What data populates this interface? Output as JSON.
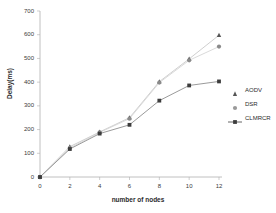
{
  "chart_data": {
    "type": "line",
    "title": "",
    "xlabel": "number of nodes",
    "ylabel": "Delay(ms)",
    "x": [
      0,
      2,
      4,
      6,
      8,
      10,
      12
    ],
    "xlim": [
      0,
      12
    ],
    "ylim": [
      0,
      700
    ],
    "xticks": [
      "0",
      "2",
      "4",
      "6",
      "8",
      "10",
      "12"
    ],
    "yticks": [
      "0",
      "100",
      "200",
      "300",
      "400",
      "500",
      "600",
      "700"
    ],
    "grid": false,
    "legend_position": "right",
    "series": [
      {
        "name": "AODV",
        "marker": "triangle",
        "color": "#555555",
        "line_color": "#c9c9c9",
        "values": [
          0,
          128,
          190,
          250,
          402,
          498,
          598
        ]
      },
      {
        "name": "DSR",
        "marker": "circle",
        "color": "#8a8a8a",
        "line_color": "#d6d6d6",
        "values": [
          0,
          122,
          188,
          246,
          398,
          492,
          550
        ]
      },
      {
        "name": "CLMRCR",
        "marker": "square",
        "color": "#3c3c3c",
        "line_color": "#8f8f8f",
        "values": [
          0,
          118,
          183,
          220,
          322,
          386,
          403
        ]
      }
    ]
  },
  "axes": {
    "y_tick_values": [
      0,
      100,
      200,
      300,
      400,
      500,
      600,
      700
    ],
    "x_tick_values": [
      0,
      2,
      4,
      6,
      8,
      10,
      12
    ]
  },
  "legend": {
    "items": [
      {
        "label": "AODV"
      },
      {
        "label": "DSR"
      },
      {
        "label": "CLMRCR"
      }
    ]
  }
}
